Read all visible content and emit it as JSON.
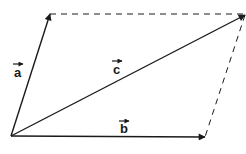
{
  "diagram": {
    "title": "",
    "type": "vector-parallelogram",
    "stroke_color": "#1a1a1a",
    "background": "#ffffff",
    "vectors": [
      {
        "name": "a",
        "label": "a",
        "from": [
          11,
          136
        ],
        "to": [
          50,
          14
        ],
        "label_pos": [
          14,
          77
        ]
      },
      {
        "name": "b",
        "label": "b",
        "from": [
          11,
          136
        ],
        "to": [
          205,
          137
        ],
        "label_pos": [
          119,
          131
        ]
      },
      {
        "name": "c",
        "label": "c",
        "from": [
          11,
          136
        ],
        "to": [
          245,
          15
        ],
        "label_pos": [
          113,
          70
        ]
      }
    ],
    "dashed_edges": [
      {
        "from": [
          50,
          14
        ],
        "to": [
          245,
          14
        ]
      },
      {
        "from": [
          245,
          15
        ],
        "to": [
          205,
          137
        ]
      }
    ]
  }
}
